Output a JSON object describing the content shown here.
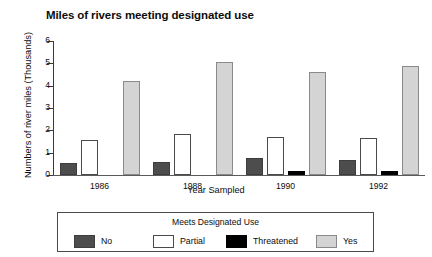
{
  "chart_data": {
    "type": "bar",
    "title": "Miles of rivers meeting designated use",
    "xlabel": "Year Sampled",
    "ylabel": "Numbers of river miles (Thousands)",
    "categories": [
      "1986",
      "1988",
      "1990",
      "1992"
    ],
    "ylim": [
      0,
      6
    ],
    "yticks": [
      "0",
      "1",
      "2",
      "3",
      "4",
      "5",
      "6"
    ],
    "grid": false,
    "legend_position": "below-plot",
    "legend_title": "Meets Designated Use",
    "series": [
      {
        "name": "No",
        "color": "#4d4d4d",
        "values": [
          0.55,
          0.6,
          0.78,
          0.68
        ]
      },
      {
        "name": "Partial",
        "color": "#ffffff",
        "values": [
          1.58,
          1.85,
          1.72,
          1.65
        ]
      },
      {
        "name": "Threatened",
        "color": "#000000",
        "values": [
          0,
          0,
          0.2,
          0.17
        ]
      },
      {
        "name": "Yes",
        "color": "#d4d4d4",
        "values": [
          4.22,
          5.08,
          4.62,
          4.88
        ]
      }
    ]
  },
  "chart": {
    "title": "Miles of rivers meeting designated use",
    "x_axis_title": "Year Sampled",
    "y_axis_title": "Numbers of river miles (Thousands)",
    "y_ticks": [
      "6",
      "5",
      "4",
      "3",
      "2",
      "1",
      "0"
    ],
    "x_ticks": [
      "1986",
      "1988",
      "1990",
      "1992"
    ]
  },
  "legend": {
    "title": "Meets Designated Use",
    "items": [
      {
        "label": "No"
      },
      {
        "label": "Partial"
      },
      {
        "label": "Threatened"
      },
      {
        "label": "Yes"
      }
    ]
  }
}
